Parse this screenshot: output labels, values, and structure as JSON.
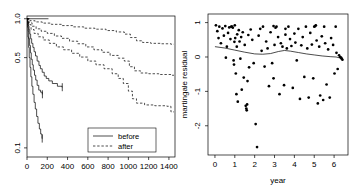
{
  "figure": {
    "title": "",
    "panels": [
      "survival-curves",
      "martingale-residuals"
    ]
  },
  "chart_data": [
    {
      "type": "line",
      "id": "survival-curves",
      "title": "",
      "xlabel": "",
      "ylabel": "",
      "xlim": [
        0,
        1460
      ],
      "ylim": [
        0.085,
        1.05
      ],
      "yscale": "log",
      "grid": false,
      "xticks": [
        0,
        200,
        400,
        600,
        800,
        1000,
        1200,
        1400
      ],
      "xticklabels": [
        "0",
        "200",
        "400",
        "600",
        "800",
        "1000",
        "1200",
        "1400"
      ],
      "yticks": [
        1.0,
        0.5,
        0.1
      ],
      "yticklabels": [
        "1.0",
        "0.5",
        "0.1"
      ],
      "legend": {
        "position": "bottom-right",
        "entries": [
          {
            "label": "before",
            "style": "solid"
          },
          {
            "label": "after",
            "style": "dashed"
          }
        ]
      },
      "series": [
        {
          "name": "before-upper",
          "style": "solid",
          "points": [
            [
              0,
              1.0
            ],
            [
              210,
              1.0
            ],
            [
              212,
              1.0
            ]
          ]
        },
        {
          "name": "before-1",
          "style": "solid",
          "points": [
            [
              0,
              1.0
            ],
            [
              8,
              0.94
            ],
            [
              14,
              0.88
            ],
            [
              20,
              0.82
            ],
            [
              28,
              0.76
            ],
            [
              36,
              0.7
            ],
            [
              46,
              0.645
            ],
            [
              58,
              0.6
            ],
            [
              70,
              0.555
            ],
            [
              84,
              0.515
            ],
            [
              100,
              0.47
            ],
            [
              118,
              0.435
            ],
            [
              132,
              0.41
            ],
            [
              150,
              0.385
            ],
            [
              170,
              0.36
            ],
            [
              190,
              0.345
            ],
            [
              215,
              0.33
            ],
            [
              250,
              0.315
            ],
            [
              300,
              0.3
            ],
            [
              345,
              0.295
            ],
            [
              348,
              0.295
            ]
          ]
        },
        {
          "name": "before-2",
          "style": "solid",
          "points": [
            [
              0,
              1.0
            ],
            [
              6,
              0.9
            ],
            [
              12,
              0.8
            ],
            [
              18,
              0.7
            ],
            [
              26,
              0.62
            ],
            [
              34,
              0.545
            ],
            [
              42,
              0.485
            ],
            [
              52,
              0.44
            ],
            [
              62,
              0.4
            ],
            [
              74,
              0.365
            ],
            [
              86,
              0.335
            ],
            [
              100,
              0.305
            ],
            [
              116,
              0.28
            ],
            [
              134,
              0.27
            ],
            [
              150,
              0.26
            ],
            [
              152,
              0.26
            ]
          ]
        },
        {
          "name": "before-3",
          "style": "solid",
          "points": [
            [
              0,
              1.0
            ],
            [
              5,
              0.86
            ],
            [
              10,
              0.72
            ],
            [
              16,
              0.6
            ],
            [
              22,
              0.5
            ],
            [
              30,
              0.42
            ],
            [
              38,
              0.355
            ],
            [
              48,
              0.3
            ],
            [
              58,
              0.26
            ],
            [
              70,
              0.225
            ],
            [
              82,
              0.2
            ],
            [
              95,
              0.175
            ],
            [
              108,
              0.155
            ],
            [
              122,
              0.14
            ],
            [
              135,
              0.128
            ],
            [
              148,
              0.118
            ],
            [
              150,
              0.118
            ]
          ]
        },
        {
          "name": "after-1",
          "style": "dashed",
          "points": [
            [
              0,
              1.0
            ],
            [
              30,
              0.965
            ],
            [
              80,
              0.945
            ],
            [
              150,
              0.925
            ],
            [
              240,
              0.905
            ],
            [
              340,
              0.885
            ],
            [
              450,
              0.865
            ],
            [
              560,
              0.845
            ],
            [
              670,
              0.83
            ],
            [
              780,
              0.81
            ],
            [
              880,
              0.79
            ],
            [
              960,
              0.76
            ],
            [
              1020,
              0.715
            ],
            [
              1080,
              0.675
            ],
            [
              1140,
              0.655
            ],
            [
              1220,
              0.645
            ],
            [
              1320,
              0.64
            ],
            [
              1420,
              0.635
            ],
            [
              1450,
              0.635
            ]
          ]
        },
        {
          "name": "after-2",
          "style": "dashed",
          "points": [
            [
              0,
              1.0
            ],
            [
              20,
              0.93
            ],
            [
              50,
              0.875
            ],
            [
              90,
              0.835
            ],
            [
              140,
              0.8
            ],
            [
              200,
              0.77
            ],
            [
              270,
              0.735
            ],
            [
              340,
              0.705
            ],
            [
              420,
              0.67
            ],
            [
              500,
              0.64
            ],
            [
              580,
              0.605
            ],
            [
              660,
              0.575
            ],
            [
              740,
              0.55
            ],
            [
              820,
              0.52
            ],
            [
              900,
              0.495
            ],
            [
              960,
              0.47
            ],
            [
              1010,
              0.425
            ],
            [
              1060,
              0.395
            ],
            [
              1120,
              0.38
            ],
            [
              1200,
              0.375
            ],
            [
              1300,
              0.37
            ],
            [
              1420,
              0.365
            ],
            [
              1450,
              0.365
            ]
          ]
        },
        {
          "name": "after-3",
          "style": "dashed",
          "points": [
            [
              0,
              1.0
            ],
            [
              15,
              0.9
            ],
            [
              40,
              0.825
            ],
            [
              70,
              0.77
            ],
            [
              110,
              0.725
            ],
            [
              160,
              0.685
            ],
            [
              220,
              0.645
            ],
            [
              290,
              0.605
            ],
            [
              360,
              0.575
            ],
            [
              440,
              0.54
            ],
            [
              520,
              0.505
            ],
            [
              600,
              0.47
            ],
            [
              680,
              0.44
            ],
            [
              760,
              0.41
            ],
            [
              840,
              0.375
            ],
            [
              900,
              0.345
            ],
            [
              950,
              0.315
            ],
            [
              1000,
              0.275
            ],
            [
              1040,
              0.24
            ],
            [
              1080,
              0.222
            ],
            [
              1160,
              0.215
            ],
            [
              1260,
              0.212
            ],
            [
              1380,
              0.21
            ],
            [
              1420,
              0.19
            ],
            [
              1450,
              0.19
            ]
          ]
        }
      ]
    },
    {
      "type": "scatter",
      "id": "martingale-residuals",
      "title": "",
      "xlabel": "year",
      "ylabel": "martingale residual",
      "xlim": [
        -0.35,
        6.7
      ],
      "ylim": [
        -2.85,
        1.25
      ],
      "grid": false,
      "xticks": [
        0,
        1,
        2,
        3,
        4,
        5,
        6
      ],
      "xticklabels": [
        "0",
        "1",
        "2",
        "3",
        "4",
        "5",
        "6"
      ],
      "yticks": [
        1,
        0,
        -1,
        -2
      ],
      "yticklabels": [
        "1",
        "0",
        "-1",
        "-2"
      ],
      "points": [
        [
          0.05,
          0.92
        ],
        [
          0.12,
          0.75
        ],
        [
          0.18,
          0.55
        ],
        [
          0.22,
          0.88
        ],
        [
          0.3,
          0.4
        ],
        [
          0.38,
          0.83
        ],
        [
          0.45,
          0.62
        ],
        [
          0.52,
          0.9
        ],
        [
          0.6,
          0.3
        ],
        [
          0.66,
          0.7
        ],
        [
          0.72,
          0.86
        ],
        [
          0.78,
          0.52
        ],
        [
          0.82,
          0.88
        ],
        [
          0.86,
          0.88
        ],
        [
          0.9,
          0.85
        ],
        [
          0.94,
          -0.1
        ],
        [
          0.96,
          -0.22
        ],
        [
          0.98,
          0.44
        ],
        [
          1.0,
          0.92
        ],
        [
          1.02,
          0.55
        ],
        [
          1.05,
          -0.48
        ],
        [
          1.08,
          -1.08
        ],
        [
          1.1,
          0.3
        ],
        [
          1.12,
          0.66
        ],
        [
          1.15,
          -1.3
        ],
        [
          1.2,
          0.78
        ],
        [
          1.24,
          0.45
        ],
        [
          1.28,
          -0.05
        ],
        [
          1.32,
          0.58
        ],
        [
          1.4,
          0.72
        ],
        [
          1.45,
          -0.6
        ],
        [
          1.5,
          0.35
        ],
        [
          1.55,
          -1.42
        ],
        [
          1.58,
          -1.5
        ],
        [
          1.6,
          -1.55
        ],
        [
          1.62,
          -1.38
        ],
        [
          1.64,
          -0.7
        ],
        [
          1.68,
          0.64
        ],
        [
          1.72,
          -0.3
        ],
        [
          1.8,
          0.8
        ],
        [
          1.88,
          0.5
        ],
        [
          1.95,
          -0.18
        ],
        [
          2.05,
          -1.95
        ],
        [
          2.12,
          -2.62
        ],
        [
          2.2,
          0.62
        ],
        [
          2.28,
          0.82
        ],
        [
          2.35,
          0.18
        ],
        [
          2.42,
          0.88
        ],
        [
          2.5,
          -0.28
        ],
        [
          2.58,
          0.45
        ],
        [
          2.65,
          0.25
        ],
        [
          2.72,
          -0.85
        ],
        [
          2.8,
          0.72
        ],
        [
          2.88,
          -0.18
        ],
        [
          2.95,
          0.9
        ],
        [
          3.0,
          0.35
        ],
        [
          3.05,
          0.85
        ],
        [
          3.1,
          0.88
        ],
        [
          3.18,
          0.58
        ],
        [
          3.25,
          -1.08
        ],
        [
          3.32,
          0.4
        ],
        [
          3.4,
          0.3
        ],
        [
          3.48,
          -0.82
        ],
        [
          3.55,
          0.82
        ],
        [
          3.62,
          0.25
        ],
        [
          3.7,
          0.88
        ],
        [
          3.78,
          0.52
        ],
        [
          3.85,
          0.32
        ],
        [
          3.92,
          -0.9
        ],
        [
          4.0,
          0.68
        ],
        [
          4.05,
          0.42
        ],
        [
          4.12,
          -0.1
        ],
        [
          4.2,
          0.82
        ],
        [
          4.28,
          -1.22
        ],
        [
          4.35,
          0.34
        ],
        [
          4.42,
          0.58
        ],
        [
          4.5,
          -0.58
        ],
        [
          4.58,
          0.88
        ],
        [
          4.65,
          0.25
        ],
        [
          4.72,
          -1.18
        ],
        [
          4.8,
          0.7
        ],
        [
          4.88,
          0.36
        ],
        [
          4.95,
          -0.62
        ],
        [
          5.0,
          0.88
        ],
        [
          5.05,
          0.9
        ],
        [
          5.08,
          0.92
        ],
        [
          5.12,
          0.48
        ],
        [
          5.18,
          -1.35
        ],
        [
          5.25,
          0.3
        ],
        [
          5.3,
          -1.12
        ],
        [
          5.38,
          0.6
        ],
        [
          5.45,
          -1.25
        ],
        [
          5.5,
          0.88
        ],
        [
          5.55,
          0.4
        ],
        [
          5.62,
          -0.8
        ],
        [
          5.7,
          0.22
        ],
        [
          5.78,
          -1.18
        ],
        [
          5.85,
          0.55
        ],
        [
          5.95,
          0.35
        ],
        [
          6.02,
          -0.48
        ],
        [
          6.08,
          0.88
        ],
        [
          6.12,
          0.12
        ],
        [
          6.18,
          -0.35
        ],
        [
          6.25,
          0.05
        ],
        [
          6.3,
          0.0
        ],
        [
          6.35,
          -0.02
        ],
        [
          6.38,
          -0.05
        ],
        [
          6.42,
          -0.08
        ],
        [
          2.95,
          -0.62
        ],
        [
          1.35,
          -0.95
        ],
        [
          0.55,
          -0.02
        ],
        [
          3.55,
          0.65
        ]
      ],
      "smooth_line": {
        "name": "lowess",
        "points": [
          [
            0.0,
            0.3
          ],
          [
            0.5,
            0.26
          ],
          [
            1.0,
            0.2
          ],
          [
            1.5,
            0.14
          ],
          [
            2.0,
            0.09
          ],
          [
            2.4,
            0.08
          ],
          [
            2.8,
            0.1
          ],
          [
            3.2,
            0.16
          ],
          [
            3.5,
            0.19
          ],
          [
            3.8,
            0.17
          ],
          [
            4.2,
            0.13
          ],
          [
            4.6,
            0.09
          ],
          [
            5.0,
            0.06
          ],
          [
            5.4,
            0.03
          ],
          [
            5.8,
            0.01
          ],
          [
            6.1,
            0.0
          ],
          [
            6.45,
            -0.05
          ]
        ]
      }
    }
  ]
}
